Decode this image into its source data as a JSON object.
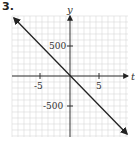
{
  "problem_number": "3.",
  "chart_data": {
    "type": "line",
    "title": "",
    "xlabel": "t",
    "ylabel": "y",
    "xlim": [
      -10,
      10
    ],
    "ylim": [
      -1000,
      1000
    ],
    "x_ticks": [
      -5,
      5
    ],
    "x_tick_labels": [
      "-5",
      "5"
    ],
    "y_ticks": [
      -500,
      500
    ],
    "y_tick_labels": [
      "-500",
      "500"
    ],
    "grid": true,
    "series": [
      {
        "name": "y = -100t",
        "x": [
          -9.5,
          9.5
        ],
        "values": [
          950,
          -950
        ],
        "arrows_both_ends": true
      }
    ]
  },
  "colors": {
    "grid": "#d8d8d8",
    "axis": "#333333",
    "line": "#222222"
  }
}
